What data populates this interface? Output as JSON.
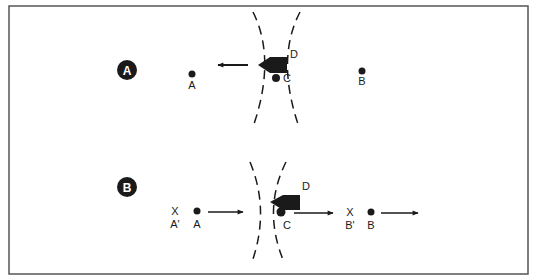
{
  "diagram": {
    "panels": [
      {
        "id": "A",
        "badge": "A",
        "points": {
          "A": {
            "label": "A"
          },
          "B": {
            "label": "B"
          },
          "C": {
            "label": "C"
          },
          "D": {
            "label": "D"
          }
        },
        "arrows": [
          {
            "from": "D",
            "direction": "left"
          }
        ]
      },
      {
        "id": "B",
        "badge": "B",
        "points": {
          "A_prime": {
            "label": "A'",
            "marker": "X"
          },
          "A": {
            "label": "A"
          },
          "C": {
            "label": "C"
          },
          "D": {
            "label": "D"
          },
          "B_prime": {
            "label": "B'",
            "marker": "X"
          },
          "B": {
            "label": "B"
          }
        },
        "arrows": [
          {
            "from": "A",
            "direction": "right"
          },
          {
            "from": "C",
            "direction": "right"
          },
          {
            "from": "B",
            "direction": "right"
          }
        ]
      }
    ],
    "colors": {
      "ink": "#1a1a1a",
      "frame": "#555555",
      "background": "#ffffff"
    }
  }
}
